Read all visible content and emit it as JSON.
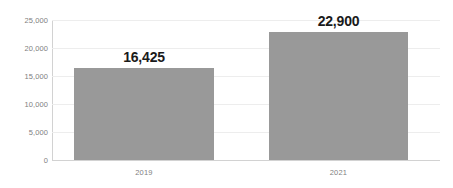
{
  "chart_data": {
    "type": "bar",
    "title": "",
    "subtitle": "",
    "xlabel": "",
    "ylabel": "",
    "categories": [
      "2019",
      "2021"
    ],
    "values": [
      16425,
      22900
    ],
    "data_labels": [
      "16,425",
      "22,900"
    ],
    "ylim": [
      0,
      25000
    ],
    "y_ticks": [
      0,
      5000,
      10000,
      15000,
      20000,
      25000
    ],
    "y_tick_labels": [
      "0",
      "5,000",
      "10,000",
      "15,000",
      "20,000",
      "25,000"
    ],
    "grid": true,
    "grid_axis": "y",
    "legend": false,
    "legend_position": "none",
    "series": [
      {
        "name": "",
        "values": [
          16425,
          22900
        ],
        "color": "#999999"
      }
    ]
  },
  "colors": {
    "bar": "#999999",
    "gridline": "#ededed",
    "axis_line": "#d2d2d2",
    "tick_text": "#808080",
    "value_text": "#1a1a1a",
    "background": "#ffffff"
  }
}
